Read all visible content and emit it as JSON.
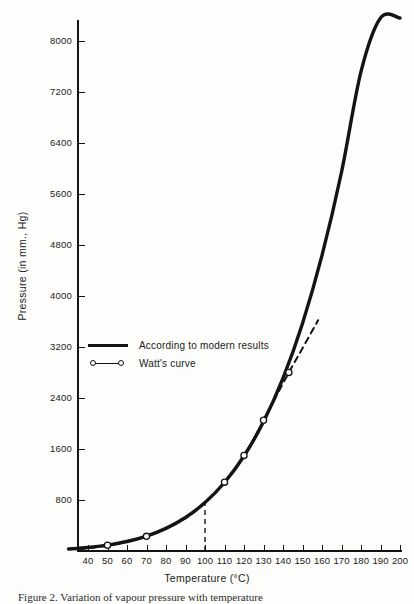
{
  "figure": {
    "caption": "Figure 2.  Variation of vapour pressure with temperature"
  },
  "chart_data": {
    "type": "line",
    "title": "",
    "xlabel": "Temperature (°C)",
    "ylabel": "Pressure (in mm., Hg)",
    "xlim": [
      30,
      200
    ],
    "ylim": [
      0,
      11600
    ],
    "grid": false,
    "legend_position": "center-left",
    "xticks": [
      40,
      50,
      60,
      70,
      80,
      90,
      100,
      110,
      120,
      130,
      140,
      150,
      160,
      170,
      180,
      190,
      200
    ],
    "xtick_labels": [
      "40",
      "50",
      "60",
      "70",
      "80",
      "90",
      "100",
      "110",
      "120",
      "130",
      "140",
      "150",
      "160",
      "170",
      "180",
      "190",
      "200"
    ],
    "yticks": [
      800,
      1600,
      2400,
      3200,
      4000,
      4800,
      5600,
      6400,
      7200,
      8000,
      8800,
      9600,
      10400,
      11200
    ],
    "ytick_labels": [
      "800",
      "1600",
      "2400",
      "3200",
      "4000",
      "4800",
      "5600",
      "6400",
      "7200",
      "8000",
      "8800",
      "9600",
      "10,400",
      "11,200"
    ],
    "annotations": [
      {
        "name": "reference-line-100c",
        "type": "vertical-dashed-line",
        "x": 100,
        "y_from": 0,
        "y_to": 800
      }
    ],
    "series": [
      {
        "name": "According to modern results",
        "style": "solid",
        "linewidth": "thick",
        "markers": "none",
        "x": [
          30,
          40,
          50,
          60,
          70,
          80,
          90,
          100,
          110,
          120,
          130,
          140,
          150,
          160,
          170,
          180,
          190,
          200
        ],
        "y": [
          32,
          55,
          93,
          149,
          234,
          355,
          526,
          760,
          1075,
          1490,
          2027,
          2711,
          3570,
          4636,
          5941,
          7520,
          9412,
          11660
        ]
      },
      {
        "name": "Watt's curve",
        "style": "dashed-below-100-and-above-150",
        "linewidth": "thin",
        "markers": "open-circle",
        "x": [
          35,
          50,
          70,
          90,
          100,
          110,
          120,
          130,
          143,
          150,
          158
        ],
        "y": [
          30,
          90,
          230,
          520,
          760,
          1080,
          1500,
          2050,
          2800,
          3180,
          3620
        ],
        "marker_points": [
          {
            "x": 50,
            "y": 90
          },
          {
            "x": 70,
            "y": 230
          },
          {
            "x": 110,
            "y": 1080
          },
          {
            "x": 120,
            "y": 1500
          },
          {
            "x": 130,
            "y": 2050
          },
          {
            "x": 143,
            "y": 2800
          }
        ]
      }
    ]
  }
}
